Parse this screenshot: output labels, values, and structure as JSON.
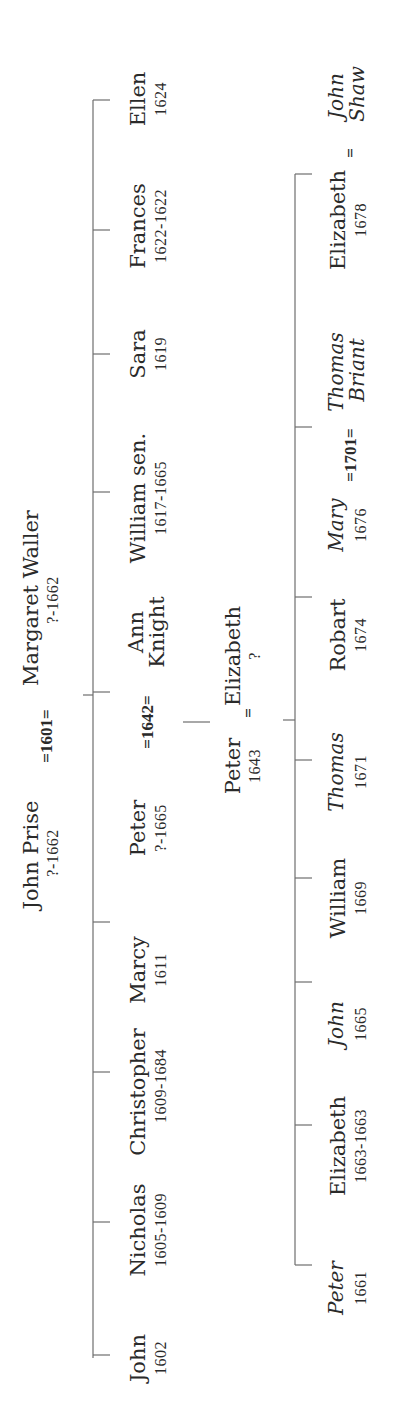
{
  "generation_1": {
    "husband": {
      "name": "John Prise",
      "dates": "?-1662"
    },
    "marriage": "=1601=",
    "wife": {
      "name": "Margaret Waller",
      "dates": "?-1662"
    }
  },
  "generation_2": [
    {
      "name": "John",
      "dates": "1602"
    },
    {
      "name": "Nicholas",
      "dates": "1605-1609"
    },
    {
      "name": "Christopher",
      "dates": "1609-1684"
    },
    {
      "name": "Marcy",
      "dates": "1611"
    },
    {
      "name": "Peter",
      "dates": "?-1665"
    },
    {
      "name": "William sen.",
      "dates": "1617-1665"
    },
    {
      "name": "Sara",
      "dates": "1619"
    },
    {
      "name": "Frances",
      "dates": "1622-1622"
    },
    {
      "name": "Ellen",
      "dates": "1624"
    }
  ],
  "generation_2_marriage": {
    "marriage": "=1642=",
    "spouse_line1": "Ann",
    "spouse_line2": "Knight"
  },
  "generation_3": {
    "husband": {
      "name": "Peter",
      "dates": "1643"
    },
    "marriage": "=",
    "wife": {
      "name": "Elizabeth",
      "dates": "?"
    }
  },
  "generation_4": [
    {
      "name": "Peter",
      "dates": "1661",
      "italic": true
    },
    {
      "name": "Elizabeth",
      "dates": "1663-1663",
      "italic": false
    },
    {
      "name": "John",
      "dates": "1665",
      "italic": true
    },
    {
      "name": "William",
      "dates": "1669",
      "italic": false
    },
    {
      "name": "Thomas",
      "dates": "1671",
      "italic": true
    },
    {
      "name": "Robart",
      "dates": "1674",
      "italic": false
    },
    {
      "name": "Mary",
      "dates": "1676",
      "italic": true
    },
    {
      "name": "Elizabeth",
      "dates": "1678",
      "italic": false
    }
  ],
  "generation_4_marriages": [
    {
      "marriage": "=1701=",
      "spouse_line1": "Thomas",
      "spouse_line2": "Briant"
    },
    {
      "marriage": "=",
      "spouse_line1": "John",
      "spouse_line2": "Shaw"
    }
  ],
  "colors": {
    "line": "#6e6e6e",
    "text": "#2a2a2a",
    "background": "#ffffff"
  }
}
